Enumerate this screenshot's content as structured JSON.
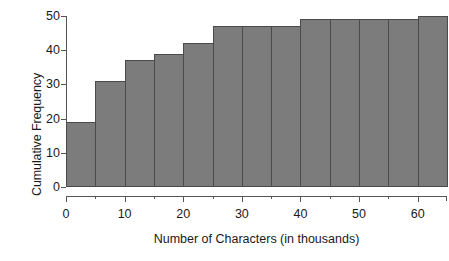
{
  "chart_data": {
    "type": "bar",
    "title": "",
    "subtitle": "",
    "xlabel": "Number of Characters (in thousands)",
    "ylabel": "Cumulative Frequency",
    "xlim": [
      0,
      65
    ],
    "ylim": [
      0,
      50
    ],
    "grid": false,
    "legend": null,
    "bar_style": "histogram-adjacent",
    "bin_width": 5,
    "x_bin_starts": [
      0,
      5,
      10,
      15,
      20,
      25,
      30,
      35,
      40,
      45,
      50,
      55,
      60
    ],
    "x_bin_ends": [
      5,
      10,
      15,
      20,
      25,
      30,
      35,
      40,
      45,
      50,
      55,
      60,
      65
    ],
    "categories": [
      "0-5",
      "5-10",
      "10-15",
      "15-20",
      "20-25",
      "25-30",
      "30-35",
      "35-40",
      "40-45",
      "45-50",
      "50-55",
      "55-60",
      "60-65"
    ],
    "values": [
      19,
      31,
      37,
      39,
      42,
      47,
      47,
      47,
      49,
      49,
      49,
      49,
      50
    ],
    "x_ticks_major": [
      0,
      10,
      20,
      30,
      40,
      50,
      60
    ],
    "x_ticks_minor": [
      5,
      15,
      25,
      35,
      45,
      55
    ],
    "x_tick_labels": [
      "0",
      "10",
      "20",
      "30",
      "40",
      "50",
      "60"
    ],
    "y_ticks": [
      0,
      10,
      20,
      30,
      40,
      50
    ],
    "y_tick_labels": [
      "0",
      "10",
      "20",
      "30",
      "40",
      "50"
    ],
    "colors": {
      "bar_fill": "#7c7c7c",
      "bar_border": "#4a4a4a",
      "axis": "#555555",
      "text": "#1a1a1a",
      "background": "#ffffff"
    }
  }
}
